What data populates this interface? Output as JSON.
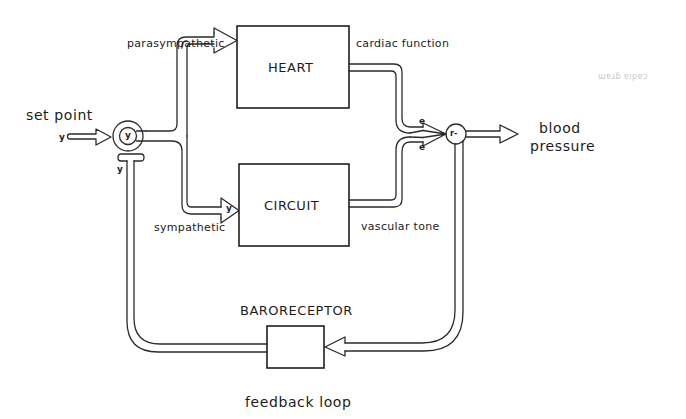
{
  "diagram": {
    "blocks": {
      "heart": "HEART",
      "circuit": "CIRCUIT",
      "baroreceptor_label": "BARORECEPTOR"
    },
    "labels": {
      "set_point": "set point",
      "parasympathetic": "parasympathetic",
      "sympathetic": "sympathetic",
      "cardiac_function": "cardiac function",
      "vascular_tone": "vascular tone",
      "blood_pressure_line1": "blood",
      "blood_pressure_line2": "pressure",
      "feedback_loop": "feedback loop"
    },
    "variables": {
      "input": "y",
      "comparator_inner": "y",
      "feedback_in": "y",
      "sympathetic_in": "y",
      "effect_top": "e",
      "effect_bottom": "e",
      "summing": "r-"
    },
    "artifact_text": "ɯɐɹɓ ɐıpɐɔ",
    "colors": {
      "ink": "#1f1f1f",
      "background": "#ffffff"
    }
  }
}
